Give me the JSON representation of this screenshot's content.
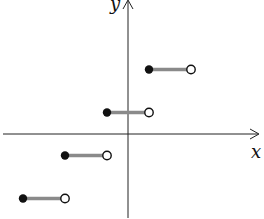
{
  "chart_data": {
    "type": "line",
    "title": "",
    "xlabel": "x",
    "ylabel": "y",
    "grid": false,
    "legend": null,
    "ticks": false,
    "series": [
      {
        "name": "step function",
        "segments": [
          {
            "x_start": -2.5,
            "x_end": -1.5,
            "y": -1.5,
            "start": "closed",
            "end": "open"
          },
          {
            "x_start": -1.5,
            "x_end": -0.5,
            "y": -0.5,
            "start": "closed",
            "end": "open"
          },
          {
            "x_start": -0.5,
            "x_end": 0.5,
            "y": 0.5,
            "start": "closed",
            "end": "open"
          },
          {
            "x_start": 0.5,
            "x_end": 1.5,
            "y": 1.5,
            "start": "closed",
            "end": "open"
          }
        ]
      }
    ],
    "colors": {
      "axis": "#222222",
      "segment": "#8a8a8a",
      "point": "#111111"
    }
  },
  "labels": {
    "x_axis": "x",
    "y_axis": "y"
  },
  "layout": {
    "origin_px": [
      128,
      134
    ],
    "unit_px_x": 42,
    "unit_px_y": 43
  }
}
